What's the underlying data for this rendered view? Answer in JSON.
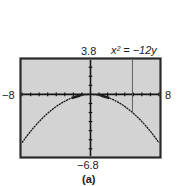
{
  "chart_data": {
    "type": "line",
    "title": "",
    "equation_label": "x² = −12y",
    "caption": "(a)",
    "xlabel": "",
    "ylabel": "",
    "xlim": [
      -8,
      8
    ],
    "ylim": [
      -6.8,
      3.8
    ],
    "x_tick_step": 1,
    "y_tick_step": 1,
    "grid": false,
    "window_labels": {
      "xmin": "−8",
      "xmax": "8",
      "ymax": "3.8",
      "ymin": "−6.8"
    },
    "series": [
      {
        "name": "x² = −12y",
        "function": "y = -x^2/12",
        "x": [
          -8,
          -7,
          -6,
          -5,
          -4,
          -3,
          -2,
          -1,
          0,
          1,
          2,
          3,
          4,
          5,
          6,
          7,
          8
        ],
        "y": [
          -5.33,
          -4.08,
          -3.0,
          -2.08,
          -1.33,
          -0.75,
          -0.33,
          -0.08,
          0,
          -0.08,
          -0.33,
          -0.75,
          -1.33,
          -2.08,
          -3.0,
          -4.08,
          -5.33
        ]
      }
    ],
    "colors": {
      "plot_background": "#d3d3d3",
      "frame": "#2a2a2a",
      "curve": "#1e1e1e",
      "axes": "#151515"
    }
  }
}
